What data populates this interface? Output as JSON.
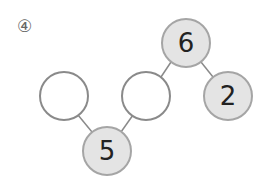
{
  "problem": {
    "label": "④"
  },
  "colors": {
    "filled_node": "#e4e4e4",
    "node_border": "#8a8a8a",
    "empty_node": "#ffffff",
    "edge": "#8a8a8a",
    "text": "#222222"
  },
  "nodes": [
    {
      "id": "top",
      "value": "6",
      "filled": true,
      "cx": 186,
      "cy": 43
    },
    {
      "id": "right",
      "value": "2",
      "filled": true,
      "cx": 228,
      "cy": 96
    },
    {
      "id": "middle",
      "value": "",
      "filled": false,
      "cx": 146,
      "cy": 96
    },
    {
      "id": "left",
      "value": "",
      "filled": false,
      "cx": 64,
      "cy": 96
    },
    {
      "id": "bottom",
      "value": "5",
      "filled": true,
      "cx": 107,
      "cy": 151
    }
  ],
  "edges": [
    {
      "from": "top",
      "to": "middle"
    },
    {
      "from": "top",
      "to": "right"
    },
    {
      "from": "bottom",
      "to": "left"
    },
    {
      "from": "bottom",
      "to": "middle"
    }
  ]
}
